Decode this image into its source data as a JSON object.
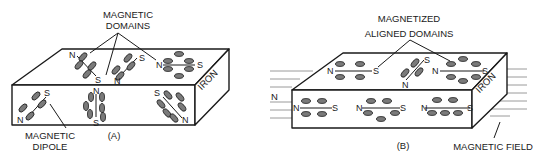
{
  "figure": {
    "panel_a": {
      "caption": "(A)",
      "material_label": "IRON",
      "callout_top_line1": "MAGNETIC",
      "callout_top_line2": "DOMAINS",
      "callout_bottom_line1": "MAGNETIC",
      "callout_bottom_line2": "DIPOLE",
      "poles": {
        "n": "N",
        "s": "S"
      }
    },
    "panel_b": {
      "caption": "(B)",
      "material_label": "IRON",
      "callout_top_line1": "MAGNETIZED",
      "callout_top_line2": "ALIGNED DOMAINS",
      "callout_bottom": "MAGNETIC FIELD",
      "field_pole_label": "N",
      "poles": {
        "n": "N",
        "s": "S"
      }
    }
  },
  "colors": {
    "line": "#1a1a1a",
    "domain_fill": "#7a7a7a",
    "field_lines": "#9a9a9a",
    "background": "#ffffff"
  }
}
